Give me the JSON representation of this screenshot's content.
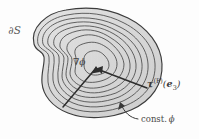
{
  "figure": {
    "kind": "contour-diagram",
    "background_color": "#ffffff",
    "ink_color": "#3a3a3a",
    "fill_color": "#dcdcdc",
    "labels": {
      "boundary": "∂S",
      "gradient": "∇ϕ",
      "traction_symbol": "τ",
      "traction_superscript": "(P)",
      "traction_argument_open": "(",
      "traction_argument_symbol": "e",
      "traction_argument_subscript": "3",
      "traction_argument_close": ")",
      "const_text": "const.",
      "const_symbol": "ϕ"
    },
    "contours": {
      "count": 8,
      "outermost_label": "∂S",
      "level_label": "const. ϕ"
    },
    "arrows": [
      {
        "name": "gradient-arrow",
        "label": "∇ϕ",
        "points_to": "center"
      },
      {
        "name": "traction-arrow",
        "label": "τ(P)(e3)",
        "points_to": "center"
      },
      {
        "name": "const-leader",
        "label": "const. ϕ",
        "points_to": "contour"
      }
    ]
  }
}
